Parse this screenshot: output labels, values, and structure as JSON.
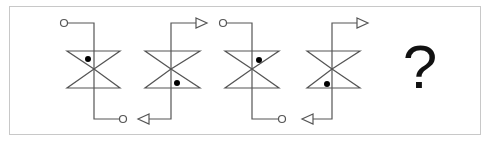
{
  "puzzle": {
    "question_mark": "?",
    "colors": {
      "stroke": "#555555",
      "dot": "#000000",
      "frame": "#c8c8c8"
    },
    "figures": [
      {
        "index": 1,
        "terminal_type": "circle",
        "dot_position": "upper-left",
        "top_lead": "left",
        "bottom_lead": "right"
      },
      {
        "index": 2,
        "terminal_type": "arrow",
        "dot_position": "lower-right",
        "top_lead": "right",
        "bottom_lead": "left"
      },
      {
        "index": 3,
        "terminal_type": "circle",
        "dot_position": "upper-right",
        "top_lead": "left",
        "bottom_lead": "right"
      },
      {
        "index": 4,
        "terminal_type": "arrow",
        "dot_position": "lower-left",
        "top_lead": "right",
        "bottom_lead": "left"
      },
      {
        "index": 5,
        "unknown": true
      }
    ]
  }
}
